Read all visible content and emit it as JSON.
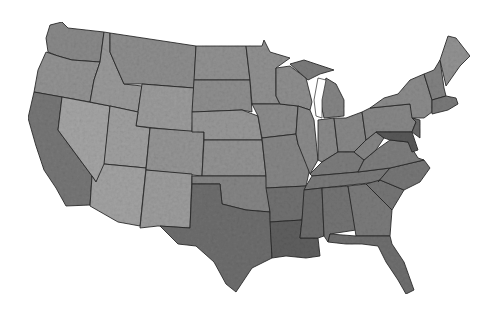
{
  "map": {
    "type": "choropleth",
    "subject": "United States counties (contiguous 48 states)",
    "color_scheme": "grayscale",
    "colors": {
      "background": "#ffffff",
      "borders": "#2a2a2a",
      "light": "#a8a8a8",
      "medium": "#8a8a8a",
      "dark": "#6a6a6a",
      "darkest": "#4a4a4a"
    },
    "legend": null,
    "title": null
  }
}
